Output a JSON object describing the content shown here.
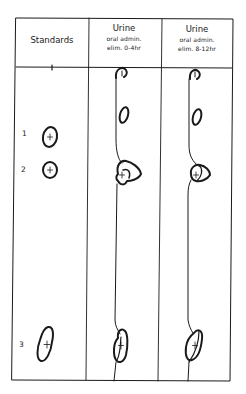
{
  "figure": {
    "columns": [
      {
        "id": "standards",
        "title": "Standards",
        "subtitle_1": "",
        "subtitle_2": ""
      },
      {
        "id": "urine-0-4",
        "title": "Urine",
        "subtitle_1": "oral admin.",
        "subtitle_2": "elim. 0-4hr"
      },
      {
        "id": "urine-8-12",
        "title": "Urine",
        "subtitle_1": "oral admin.",
        "subtitle_2": "elim. 8-12hr"
      }
    ],
    "standards": [
      {
        "label": "1"
      },
      {
        "label": "2"
      },
      {
        "label": "3"
      }
    ],
    "colors": {
      "line": "#1a1a1a",
      "background": "#ffffff"
    }
  }
}
